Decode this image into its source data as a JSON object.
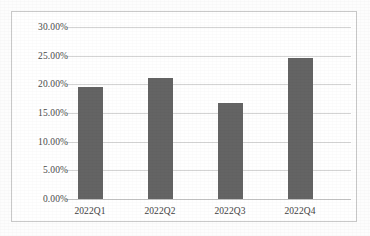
{
  "chart_data": {
    "type": "bar",
    "title": "",
    "xlabel": "",
    "ylabel": "",
    "categories": [
      "2022Q1",
      "2022Q2",
      "2022Q3",
      "2022Q4"
    ],
    "values": [
      19.5,
      21.1,
      16.8,
      24.6
    ],
    "value_labels": [
      "19.50%",
      "21.10%",
      "16.80%",
      "24.60%"
    ],
    "ylim": [
      0,
      30
    ],
    "ytick_values": [
      30,
      25,
      20,
      15,
      10,
      5,
      0
    ],
    "ytick_labels": [
      "30.00%",
      "25.00%",
      "20.00%",
      "15.00%",
      "10.00%",
      "5.00%",
      "0.00%"
    ],
    "grid": "horizontal",
    "legend": "none",
    "series": [
      {
        "name": "",
        "values": [
          19.5,
          21.1,
          16.8,
          24.6
        ],
        "color": "#646464"
      }
    ],
    "colors": {
      "bar": "#646464",
      "gridline": "#d4d4d4",
      "axis": "#c2c2c2",
      "frame": "#c9c9c9",
      "background": "#ffffff",
      "tick_text": "#4a4a4a"
    }
  }
}
